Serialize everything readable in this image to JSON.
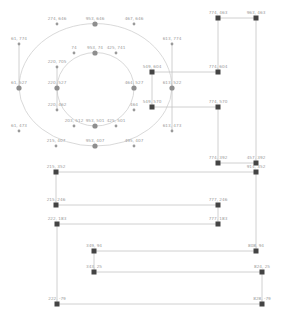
{
  "diagram": {
    "type": "node-graph",
    "colors": {
      "square_node": "#444444",
      "round_node": "#8e8e8e",
      "edge": "#c4c4c4",
      "label": "#9a9a9a",
      "background": "#ffffff"
    },
    "round_nodes": [
      {
        "label": "274, 646",
        "x": 57,
        "y": 24,
        "size": "small"
      },
      {
        "label": "953, 646",
        "x": 95,
        "y": 24,
        "size": "large"
      },
      {
        "label": "467, 646",
        "x": 134,
        "y": 24,
        "size": "small"
      },
      {
        "label": "61, 774",
        "x": 19,
        "y": 44,
        "size": "small"
      },
      {
        "label": "613, 774",
        "x": 172,
        "y": 44,
        "size": "small"
      },
      {
        "label": "953, 74",
        "x": 95,
        "y": 53,
        "size": "large"
      },
      {
        "label": "74",
        "x": 74,
        "y": 53,
        "size": "small"
      },
      {
        "label": "425, 741",
        "x": 116,
        "y": 53,
        "size": "small"
      },
      {
        "label": "220, 705",
        "x": 57,
        "y": 67,
        "size": "small"
      },
      {
        "label": "61, 527",
        "x": 19,
        "y": 88,
        "size": "large"
      },
      {
        "label": "220, 527",
        "x": 57,
        "y": 88,
        "size": "large"
      },
      {
        "label": "464, 527",
        "x": 134,
        "y": 88,
        "size": "large"
      },
      {
        "label": "613, 522",
        "x": 172,
        "y": 88,
        "size": "large"
      },
      {
        "label": "220, 462",
        "x": 57,
        "y": 110,
        "size": "small"
      },
      {
        "label": "464",
        "x": 134,
        "y": 110,
        "size": "small"
      },
      {
        "label": "203, 512",
        "x": 74,
        "y": 126,
        "size": "small"
      },
      {
        "label": "953, 501",
        "x": 95,
        "y": 126,
        "size": "large"
      },
      {
        "label": "425, 501",
        "x": 116,
        "y": 126,
        "size": "small"
      },
      {
        "label": "61, 473",
        "x": 19,
        "y": 131,
        "size": "small"
      },
      {
        "label": "613, 473",
        "x": 172,
        "y": 131,
        "size": "small"
      },
      {
        "label": "215, 407",
        "x": 56,
        "y": 146,
        "size": "small"
      },
      {
        "label": "953, 407",
        "x": 95,
        "y": 146,
        "size": "large"
      },
      {
        "label": "495, 407",
        "x": 134,
        "y": 146,
        "size": "small"
      }
    ],
    "square_nodes": [
      {
        "label": "774, 463",
        "x": 218,
        "y": 18
      },
      {
        "label": "963, 463",
        "x": 256,
        "y": 18
      },
      {
        "label": "549, 604",
        "x": 152,
        "y": 72
      },
      {
        "label": "774, 604",
        "x": 218,
        "y": 72
      },
      {
        "label": "549, 570",
        "x": 152,
        "y": 107
      },
      {
        "label": "774, 570",
        "x": 218,
        "y": 107
      },
      {
        "label": "774, 392",
        "x": 218,
        "y": 163
      },
      {
        "label": "457, 392",
        "x": 256,
        "y": 163
      },
      {
        "label": "914, 352",
        "x": 256,
        "y": 172
      },
      {
        "label": "215, 352",
        "x": 56,
        "y": 172
      },
      {
        "label": "215, 246",
        "x": 56,
        "y": 205
      },
      {
        "label": "777, 246",
        "x": 218,
        "y": 205
      },
      {
        "label": "222, 183",
        "x": 57,
        "y": 224
      },
      {
        "label": "777, 183",
        "x": 218,
        "y": 224
      },
      {
        "label": "349, 94",
        "x": 94,
        "y": 251
      },
      {
        "label": "808, 94",
        "x": 256,
        "y": 251
      },
      {
        "label": "343, 25",
        "x": 94,
        "y": 272
      },
      {
        "label": "824, 25",
        "x": 262,
        "y": 272
      },
      {
        "label": "222, -79",
        "x": 57,
        "y": 304
      },
      {
        "label": "828, -79",
        "x": 262,
        "y": 304
      }
    ]
  }
}
